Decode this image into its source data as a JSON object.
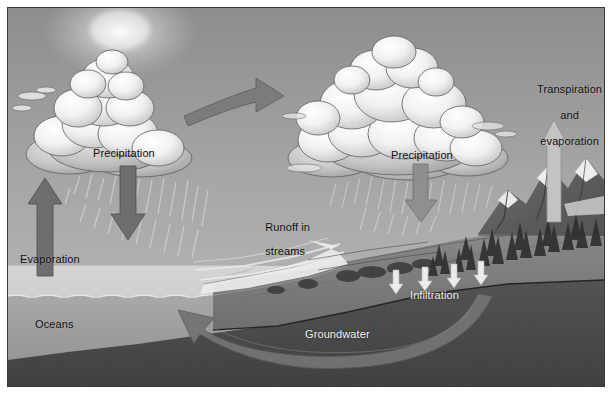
{
  "figure": {
    "style": "grayscale illustrated cross-section",
    "border_color": "#3a3a3a",
    "background_color": "#ffffff"
  },
  "labels": {
    "precipitation_left": "Precipitation",
    "precipitation_right": "Precipitation",
    "transpiration_line1": "Transpiration",
    "transpiration_line2": "and",
    "transpiration_line3": "evaporation",
    "runoff_line1": "Runoff in",
    "runoff_line2": "streams",
    "evaporation": "Evaporation",
    "oceans": "Oceans",
    "infiltration": "Infiltration",
    "groundwater": "Groundwater"
  },
  "arrows": [
    {
      "name": "evaporation-arrow",
      "direction": "up",
      "color": "#6e6e6e",
      "label": "Evaporation"
    },
    {
      "name": "precipitation-arrow-left",
      "direction": "down",
      "color": "#6e6e6e",
      "label": "Precipitation"
    },
    {
      "name": "transport-arrow",
      "direction": "right",
      "color": "#7a7a7a",
      "label": "moisture transport"
    },
    {
      "name": "precipitation-arrow-right",
      "direction": "down",
      "color": "#8a8a8a",
      "label": "Precipitation"
    },
    {
      "name": "transpiration-arrow",
      "direction": "up",
      "color": "#b9b9b9",
      "label": "Transpiration and evaporation"
    },
    {
      "name": "infiltration-arrow-1",
      "direction": "down",
      "color": "#e8e8e8",
      "label": "Infiltration"
    },
    {
      "name": "infiltration-arrow-2",
      "direction": "down",
      "color": "#e8e8e8",
      "label": "Infiltration"
    },
    {
      "name": "infiltration-arrow-3",
      "direction": "down",
      "color": "#e8e8e8",
      "label": "Infiltration"
    },
    {
      "name": "infiltration-arrow-4",
      "direction": "down",
      "color": "#e8e8e8",
      "label": "Infiltration"
    },
    {
      "name": "groundwater-arrow",
      "direction": "curved-left",
      "color": "#6b6b6b",
      "label": "Groundwater"
    }
  ],
  "scene_elements": {
    "sun": "sun-glow",
    "sky": "sky-gradient",
    "cloud_left": "cumulus-cloud",
    "cloud_right": "cumulus-cloud",
    "rain_left": "rain-streaks",
    "rain_right": "rain-streaks",
    "ocean_surface": "water-surface",
    "ocean_body": "ocean-water",
    "river_delta": "braided-river",
    "mountains": "mountain-range",
    "snowcaps": "snow-cap",
    "forest": "conifer-forest",
    "bedrock": "subsurface-rock"
  },
  "colors": {
    "sky_top": "#8f8f8f",
    "sky_bottom": "#b4b4b4",
    "cloud_light": "#f7f7f7",
    "cloud_shadow": "#9d9d9d",
    "ocean_surface": "#c9c9c9",
    "ocean_deep": "#9a9a9a",
    "land": "#7e7e7e",
    "bedrock": "#4a4a4a",
    "arrow_gray": "#6e6e6e",
    "arrow_white": "#e8e8e8",
    "text_dark": "#101010",
    "text_light": "#f2f2f2"
  }
}
